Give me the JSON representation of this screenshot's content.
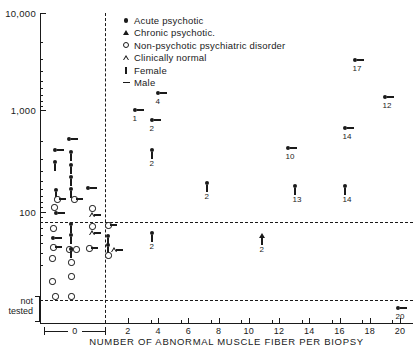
{
  "chart_data": {
    "type": "scatter",
    "title": "",
    "xlabel": "NUMBER OF ABNORMAL MUSCLE FIBER PER BIOPSY",
    "ylabel": "",
    "yscale": "log",
    "ylim": [
      100,
      10000
    ],
    "yticks": [
      "10,000",
      "1,000",
      "100"
    ],
    "y_special_label": "not tested",
    "xlim": [
      0,
      20
    ],
    "xticks": [
      "0",
      "2",
      "4",
      "6",
      "8",
      "10",
      "12",
      "14",
      "16",
      "18",
      "20"
    ],
    "grid": false,
    "legend_position": "top-right",
    "legend": [
      {
        "symbol": "filled-circle",
        "label": "Acute  psychotic"
      },
      {
        "symbol": "filled-triangle",
        "label": "Chronic  psychotic."
      },
      {
        "symbol": "open-circle",
        "label": "Non-psychotic  psychiatric  disorder"
      },
      {
        "symbol": "open-triangle",
        "label": "Clinically  normal"
      },
      {
        "symbol": "vertical-bar",
        "label": "Female"
      },
      {
        "symbol": "horizontal-dash",
        "label": "Male"
      }
    ],
    "points": [
      {
        "px": 69,
        "py": 139,
        "marker": "filled-circle",
        "sex": "male",
        "label": ""
      },
      {
        "px": 55,
        "py": 150,
        "marker": "filled-circle",
        "sex": "male",
        "label": ""
      },
      {
        "px": 71,
        "py": 152,
        "marker": "filled-circle",
        "sex": "female",
        "label": ""
      },
      {
        "px": 55,
        "py": 162,
        "marker": "filled-circle",
        "sex": "female",
        "label": ""
      },
      {
        "px": 71,
        "py": 165,
        "marker": "filled-circle",
        "sex": "female",
        "label": ""
      },
      {
        "px": 71,
        "py": 177,
        "marker": "filled-circle",
        "sex": "female",
        "label": ""
      },
      {
        "px": 56,
        "py": 190,
        "marker": "filled-circle",
        "sex": "female",
        "label": ""
      },
      {
        "px": 71,
        "py": 189,
        "marker": "filled-circle",
        "sex": "female",
        "label": ""
      },
      {
        "px": 88,
        "py": 188,
        "marker": "filled-circle",
        "sex": "male",
        "label": ""
      },
      {
        "px": 57,
        "py": 199,
        "marker": "open-circle",
        "sex": "male",
        "label": ""
      },
      {
        "px": 74,
        "py": 199,
        "marker": "open-circle",
        "sex": "male",
        "label": ""
      },
      {
        "px": 54,
        "py": 207,
        "marker": "open-circle",
        "sex": "none",
        "label": ""
      },
      {
        "px": 56,
        "py": 213,
        "marker": "filled-circle",
        "sex": "male",
        "label": ""
      },
      {
        "px": 92,
        "py": 208,
        "marker": "open-circle",
        "sex": "none",
        "label": ""
      },
      {
        "px": 92,
        "py": 215,
        "marker": "open-triangle",
        "sex": "male",
        "label": ""
      },
      {
        "px": 71,
        "py": 224,
        "marker": "filled-circle",
        "sex": "female",
        "label": ""
      },
      {
        "px": 53,
        "py": 228,
        "marker": "open-circle",
        "sex": "none",
        "label": ""
      },
      {
        "px": 92,
        "py": 226,
        "marker": "open-circle",
        "sex": "none",
        "label": ""
      },
      {
        "px": 92,
        "py": 233,
        "marker": "open-triangle",
        "sex": "male",
        "label": ""
      },
      {
        "px": 53,
        "py": 238,
        "marker": "filled-circle",
        "sex": "male",
        "label": ""
      },
      {
        "px": 71,
        "py": 235,
        "marker": "filled-circle",
        "sex": "female",
        "label": ""
      },
      {
        "px": 53,
        "py": 247,
        "marker": "open-circle",
        "sex": "male",
        "label": ""
      },
      {
        "px": 108,
        "py": 225,
        "marker": "open-circle",
        "sex": "male",
        "label": ""
      },
      {
        "px": 108,
        "py": 236,
        "marker": "filled-circle",
        "sex": "female",
        "label": ""
      },
      {
        "px": 108,
        "py": 245,
        "marker": "filled-circle",
        "sex": "female",
        "label": ""
      },
      {
        "px": 108,
        "py": 255,
        "marker": "open-circle",
        "sex": "none",
        "label": ""
      },
      {
        "px": 69,
        "py": 249,
        "marker": "open-circle",
        "sex": "none",
        "label": ""
      },
      {
        "px": 76,
        "py": 249,
        "marker": "open-circle",
        "sex": "none",
        "label": ""
      },
      {
        "px": 89,
        "py": 248,
        "marker": "open-circle",
        "sex": "male",
        "label": ""
      },
      {
        "px": 114,
        "py": 250,
        "marker": "open-triangle",
        "sex": "male",
        "label": ""
      },
      {
        "px": 52,
        "py": 258,
        "marker": "open-circle",
        "sex": "none",
        "label": ""
      },
      {
        "px": 71,
        "py": 249,
        "marker": "filled-circle",
        "sex": "female",
        "label": ""
      },
      {
        "px": 71,
        "py": 262,
        "marker": "open-circle",
        "sex": "none",
        "label": ""
      },
      {
        "px": 71,
        "py": 276,
        "marker": "open-circle",
        "sex": "none",
        "label": ""
      },
      {
        "px": 52,
        "py": 281,
        "marker": "open-circle",
        "sex": "none",
        "label": ""
      },
      {
        "px": 55,
        "py": 296,
        "marker": "open-circle",
        "sex": "none",
        "label": ""
      },
      {
        "px": 71,
        "py": 296,
        "marker": "open-circle",
        "sex": "none",
        "label": ""
      },
      {
        "px": 135,
        "py": 110,
        "marker": "filled-circle",
        "sex": "male",
        "label": "1"
      },
      {
        "px": 152,
        "py": 120,
        "marker": "filled-circle",
        "sex": "male",
        "label": "2"
      },
      {
        "px": 158,
        "py": 93,
        "marker": "filled-circle",
        "sex": "male",
        "label": "4"
      },
      {
        "px": 152,
        "py": 150,
        "marker": "filled-circle",
        "sex": "female",
        "label": "2"
      },
      {
        "px": 207,
        "py": 183,
        "marker": "filled-circle",
        "sex": "female",
        "label": "2"
      },
      {
        "px": 152,
        "py": 233,
        "marker": "filled-circle",
        "sex": "female",
        "label": "2"
      },
      {
        "px": 262,
        "py": 236,
        "marker": "filled-triangle",
        "sex": "female",
        "label": "2"
      },
      {
        "px": 288,
        "py": 148,
        "marker": "filled-circle",
        "sex": "male",
        "label": "10"
      },
      {
        "px": 295,
        "py": 186,
        "marker": "filled-circle",
        "sex": "female",
        "label": "13"
      },
      {
        "px": 345,
        "py": 128,
        "marker": "filled-circle",
        "sex": "male",
        "label": "14"
      },
      {
        "px": 345,
        "py": 186,
        "marker": "filled-circle",
        "sex": "female",
        "label": "14"
      },
      {
        "px": 355,
        "py": 60,
        "marker": "filled-circle",
        "sex": "male",
        "label": "17"
      },
      {
        "px": 385,
        "py": 97,
        "marker": "filled-circle",
        "sex": "male",
        "label": "12"
      },
      {
        "px": 398,
        "py": 308,
        "marker": "filled-circle",
        "sex": "male",
        "label": "20"
      }
    ]
  }
}
